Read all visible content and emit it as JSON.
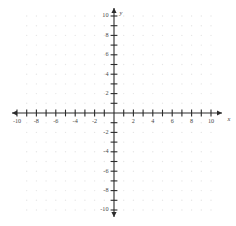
{
  "figure": {
    "background_color": "#ffffff",
    "axis_color": "#2b2b2b",
    "grid_dot_color": "#e6e6e6",
    "label_color": "#4a4a4a"
  },
  "chart_data": {
    "type": "scatter",
    "title": "",
    "xlabel": "x",
    "ylabel": "y",
    "xlim": [
      -10,
      10
    ],
    "ylim": [
      -10,
      10
    ],
    "grid": "dotted-lattice",
    "legend": "none",
    "series": [],
    "x": [],
    "y": [],
    "x_ticks": [
      -10,
      -9,
      -8,
      -7,
      -6,
      -5,
      -4,
      -3,
      -2,
      -1,
      1,
      2,
      3,
      4,
      5,
      6,
      7,
      8,
      9,
      10
    ],
    "y_ticks": [
      -10,
      -9,
      -8,
      -7,
      -6,
      -5,
      -4,
      -3,
      -2,
      -1,
      1,
      2,
      3,
      4,
      5,
      6,
      7,
      8,
      9,
      10
    ],
    "x_tick_labels": [
      {
        "value": -10,
        "text": "-10"
      },
      {
        "value": -8,
        "text": "-8"
      },
      {
        "value": -6,
        "text": "-6"
      },
      {
        "value": -4,
        "text": "-4"
      },
      {
        "value": -2,
        "text": "-2"
      },
      {
        "value": 2,
        "text": "2"
      },
      {
        "value": 4,
        "text": "4"
      },
      {
        "value": 6,
        "text": "6"
      },
      {
        "value": 8,
        "text": "8"
      },
      {
        "value": 10,
        "text": "10"
      }
    ],
    "y_tick_labels": [
      {
        "value": 10,
        "text": "10"
      },
      {
        "value": 8,
        "text": "8"
      },
      {
        "value": 6,
        "text": "6"
      },
      {
        "value": 4,
        "text": "4"
      },
      {
        "value": 2,
        "text": "2"
      },
      {
        "value": -2,
        "text": "-2"
      },
      {
        "value": -4,
        "text": "-4"
      },
      {
        "value": -6,
        "text": "-6"
      },
      {
        "value": -8,
        "text": "-8"
      },
      {
        "value": -10,
        "text": "-10"
      }
    ],
    "axis_labels": {
      "x_axis_name": "x",
      "y_axis_name": "y"
    }
  },
  "geometry": {
    "origin_x": 114,
    "origin_y": 113,
    "unit": 9.7,
    "x_axis_start": 12,
    "x_axis_end": 222,
    "y_axis_start": 8,
    "y_axis_end": 217,
    "tick_half_length": 3.4,
    "grid_x_min": -9,
    "grid_x_max": 10,
    "grid_y_min": -10,
    "grid_y_max": 10,
    "dot_radius": 0.7
  }
}
